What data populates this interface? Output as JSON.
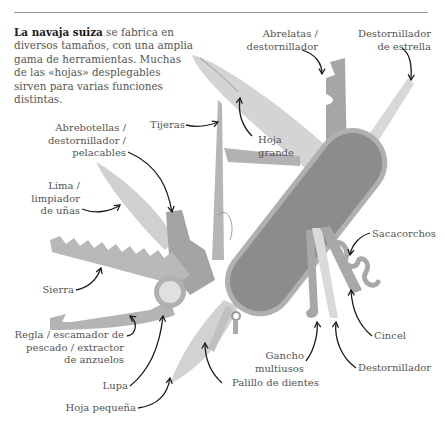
{
  "intro": {
    "bold": "La navaja suiza",
    "text": " se fabrica en diversos tamaños, con una amplia gama de herramientas. Muchas de las «hojas» desplegables sirven para varias funciones distintas."
  },
  "labels": {
    "abrelatas": "Abrelatas /\ndestornillador",
    "destornillador_estrella": "Destornillador\nde estrella",
    "hoja_grande": "Hoja\ngrande",
    "abrebotellas": "Abrebotellas /\ndestornillador /\npelacables",
    "tijeras": "Tijeras",
    "lima": "Lima /\nlimpiador\nde uñas",
    "sacacorchos": "Sacacorchos",
    "sierra": "Sierra",
    "regla": "Regla / escamador de\npescado / extractor\nde anzuelos",
    "cincel": "Cincel",
    "gancho": "Gancho\nmultiusos",
    "destornillador": "Destornillador",
    "lupa": "Lupa",
    "palillo": "Palillo de dientes",
    "hoja_pequena": "Hoja pequeña"
  },
  "colors": {
    "handle": "#8c8c8c",
    "handle_rim": "#b0b0b0",
    "tool": "#a8a8a8",
    "blade": "#cfcfcf",
    "text": "#555555",
    "arrow": "#1a1a1a"
  }
}
